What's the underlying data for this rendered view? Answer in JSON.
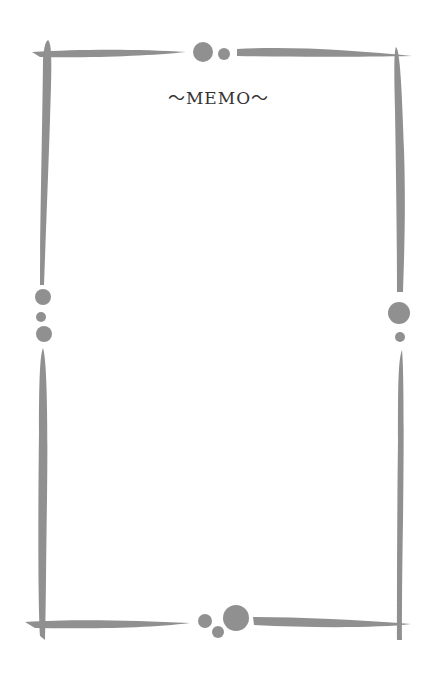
{
  "memo": {
    "title": "～MEMO～"
  },
  "colors": {
    "frame": "#909090",
    "background": "#ffffff",
    "text": "#333333"
  }
}
